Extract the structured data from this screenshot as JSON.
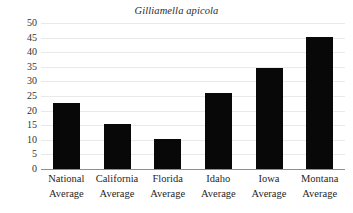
{
  "chart_data": {
    "type": "bar",
    "title": "Gilliamella apicola",
    "title_style": "italic",
    "xlabel": "",
    "ylabel": "",
    "categories": [
      "National Average",
      "California Average",
      "Florida Average",
      "Idaho Average",
      "Iowa Average",
      "Montana Average"
    ],
    "category_lines": [
      [
        "National",
        "Average"
      ],
      [
        "California",
        "Average"
      ],
      [
        "Florida",
        "Average"
      ],
      [
        "Idaho",
        "Average"
      ],
      [
        "Iowa",
        "Average"
      ],
      [
        "Montana",
        "Average"
      ]
    ],
    "values": [
      22.5,
      15.3,
      10.2,
      26.0,
      34.5,
      45.3
    ],
    "ylim": [
      0,
      50
    ],
    "ytick_labels": [
      "50",
      "45",
      "40",
      "35",
      "30",
      "25",
      "20",
      "15",
      "10",
      "5",
      "0"
    ],
    "ytick_values": [
      50,
      45,
      40,
      35,
      30,
      25,
      20,
      15,
      10,
      5,
      0
    ],
    "grid": true,
    "grid_axis": "y",
    "legend": false,
    "bar_color": "#080808",
    "gridline_color": "#e9e9e9",
    "axis_line_color": "#8e8e8e",
    "background_color": "#ffffff"
  }
}
